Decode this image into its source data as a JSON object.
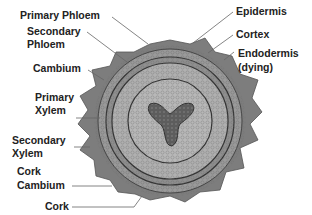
{
  "diagram": {
    "colors": {
      "outer_cork": "#7d7d7d",
      "bark_ring": "#9a9a9a",
      "phloem_ring": "#8a8a8a",
      "xylem_fill": "#b4b4b4",
      "primary_xylem": "#6e6e6e",
      "line": "#444444",
      "label_text": "#222222"
    },
    "labels_left": [
      {
        "id": "primary-phloem",
        "text": "Primary Phloem"
      },
      {
        "id": "secondary-phloem-1",
        "text": "Secondary"
      },
      {
        "id": "secondary-phloem-2",
        "text": "Phloem"
      },
      {
        "id": "cambium",
        "text": "Cambium"
      },
      {
        "id": "primary-xylem-1",
        "text": "Primary"
      },
      {
        "id": "primary-xylem-2",
        "text": "Xylem"
      },
      {
        "id": "secondary-xylem-1",
        "text": "Secondary"
      },
      {
        "id": "secondary-xylem-2",
        "text": "Xylem"
      },
      {
        "id": "cork-cambium-1",
        "text": "Cork"
      },
      {
        "id": "cork-cambium-2",
        "text": "Cambium"
      },
      {
        "id": "cork",
        "text": "Cork"
      }
    ],
    "labels_right": [
      {
        "id": "epidermis",
        "text": "Epidermis"
      },
      {
        "id": "cortex",
        "text": "Cortex"
      },
      {
        "id": "endodermis-1",
        "text": "Endodermis"
      },
      {
        "id": "endodermis-2",
        "text": "(dying)"
      }
    ]
  }
}
